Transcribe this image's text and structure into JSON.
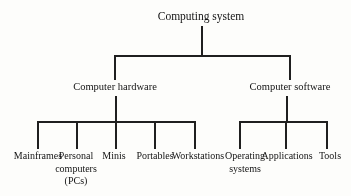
{
  "colors": {
    "background": "#fdfdfb",
    "line": "#1f1f1f",
    "text": "#141414"
  },
  "diagram": {
    "type": "tree",
    "root": {
      "label": "Computing system"
    },
    "branches": [
      {
        "label": "Computer hardware"
      },
      {
        "label": "Computer software"
      }
    ],
    "hardware_leaves": [
      {
        "lines": [
          "Mainframes"
        ]
      },
      {
        "lines": [
          "Personal",
          "computers",
          "(PCs)"
        ]
      },
      {
        "lines": [
          "Minis"
        ]
      },
      {
        "lines": [
          "Portables"
        ]
      },
      {
        "lines": [
          "Workstations"
        ]
      }
    ],
    "software_leaves": [
      {
        "lines": [
          "Operating",
          "systems"
        ]
      },
      {
        "lines": [
          "Applications"
        ]
      },
      {
        "lines": [
          "Tools"
        ]
      }
    ]
  }
}
